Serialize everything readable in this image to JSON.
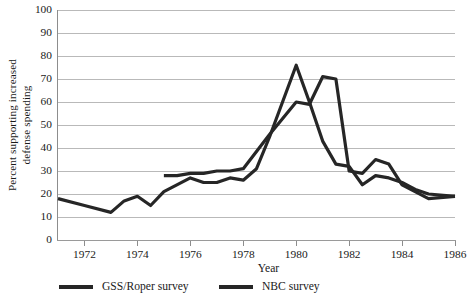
{
  "chart_data": {
    "type": "line",
    "title": "",
    "xlabel": "Year",
    "ylabel_line1": "Percent supporting increased",
    "ylabel_line2": "defense spending",
    "xlim": [
      1971,
      1986
    ],
    "ylim": [
      0,
      100
    ],
    "grid": "horizontal",
    "legend_position": "below-axis",
    "yticks": [
      100,
      90,
      80,
      70,
      60,
      50,
      40,
      30,
      20,
      10,
      0
    ],
    "xticks": [
      1972,
      1974,
      1976,
      1978,
      1980,
      1982,
      1984,
      1986
    ],
    "line_color": "#262626",
    "grid_color": "#b9b9b9",
    "series": [
      {
        "name": "GSS/Roper survey",
        "x": [
          1971,
          1972,
          1973,
          1973.5,
          1974,
          1974.5,
          1975,
          1976,
          1976.5,
          1977,
          1977.5,
          1978,
          1978.5,
          1979,
          1980,
          1980.5,
          1981,
          1981.5,
          1982,
          1982.5,
          1983,
          1983.5,
          1984,
          1984.5,
          1985,
          1986
        ],
        "values": [
          18,
          15,
          12,
          17,
          19,
          15,
          21,
          27,
          25,
          25,
          27,
          26,
          31,
          45,
          76,
          60,
          43,
          33,
          32,
          24,
          28,
          27,
          25,
          22,
          20,
          19
        ]
      },
      {
        "name": "NBC survey",
        "x": [
          1975,
          1975.5,
          1976,
          1976.5,
          1977,
          1977.5,
          1978,
          1979,
          1980,
          1980.5,
          1981,
          1981.5,
          1982,
          1982.5,
          1983,
          1983.5,
          1984,
          1985,
          1986
        ],
        "values": [
          28,
          28,
          29,
          29,
          30,
          30,
          31,
          46,
          60,
          59,
          71,
          70,
          30,
          29,
          35,
          33,
          24,
          18,
          19
        ]
      }
    ]
  },
  "legend": {
    "items": [
      {
        "label": "GSS/Roper survey"
      },
      {
        "label": "NBC survey"
      }
    ]
  }
}
